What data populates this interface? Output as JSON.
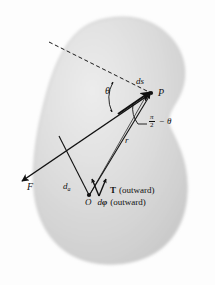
{
  "figure": {
    "colors": {
      "background": "#fdfdfd",
      "body_fill": "#d4d4d4",
      "body_fill_light": "#e6e6e6",
      "body_edge": "#bfbfbf",
      "ink": "#111111"
    }
  },
  "labels": {
    "ds": "ds",
    "point_p": "P",
    "theta": "θ",
    "r": "r",
    "pi_numerator": "π",
    "pi_denominator": "2",
    "minus_theta": "− θ",
    "force": "F",
    "moment_arm_base": "d",
    "moment_arm_sub": "a",
    "torque": "T",
    "torque_note": "(outward)",
    "point_o": "O",
    "dphi_base": "d",
    "dphi_symbol": "φ",
    "dphi_note": "(outward)"
  },
  "geometry": {
    "point_o": {
      "x": 89,
      "y": 196
    },
    "point_p": {
      "x": 152,
      "y": 93
    },
    "force_arrow_tip": {
      "x": 18,
      "y": 184
    },
    "dashed_line_start": {
      "x": 49,
      "y": 42
    }
  }
}
